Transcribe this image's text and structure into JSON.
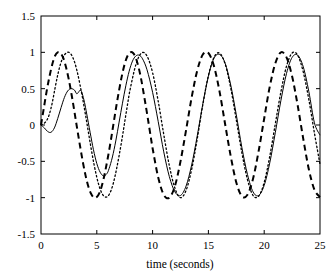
{
  "chart_data": {
    "type": "line",
    "title": "",
    "xlabel": "time (seconds)",
    "ylabel": "",
    "xlim": [
      0,
      25
    ],
    "ylim": [
      -1.5,
      1.5
    ],
    "xticks": [
      0,
      5,
      10,
      15,
      20,
      25
    ],
    "xtick_labels": [
      "0",
      "5",
      "10",
      "15",
      "20",
      "25"
    ],
    "yticks": [
      -1.5,
      -1,
      -0.5,
      0,
      0.5,
      1,
      1.5
    ],
    "ytick_labels": [
      "-1.5",
      "-1",
      "-0.5",
      "0",
      "0.5",
      "1",
      "1.5"
    ],
    "grid": false,
    "legend": "none",
    "background": "#ffffff",
    "axis_color": "#000000",
    "series": [
      {
        "name": "reference",
        "style": "dashed",
        "color": "#000000",
        "linewidth": 2.0,
        "dash": "6,4",
        "amplitude": 1.0,
        "period": 6.55,
        "phase_seconds": 1.55,
        "settling_time": 0.0,
        "points_x": [
          0,
          0.25,
          0.5,
          0.75,
          1,
          1.25,
          1.5,
          1.75,
          2,
          2.25,
          2.5,
          2.75,
          3,
          3.25,
          3.5,
          3.75,
          4,
          4.25,
          4.5,
          4.75,
          5,
          5.25,
          5.5,
          5.75,
          6,
          6.25,
          6.5,
          6.75,
          7,
          7.25,
          7.5,
          7.75,
          8,
          8.25,
          8.5,
          8.75,
          9,
          9.25,
          9.5,
          9.75,
          10,
          10.5,
          11,
          11.5,
          12,
          12.5,
          13,
          13.5,
          14,
          14.5,
          15,
          15.5,
          16,
          16.5,
          17,
          17.5,
          18,
          18.5,
          19,
          19.5,
          20,
          20.5,
          21,
          21.5,
          22,
          22.5,
          23,
          23.5,
          24,
          24.5,
          25
        ],
        "points_y": [
          0,
          0.23,
          0.46,
          0.66,
          0.83,
          0.95,
          1.0,
          0.99,
          0.92,
          0.79,
          0.62,
          0.41,
          0.18,
          -0.06,
          -0.29,
          -0.51,
          -0.7,
          -0.85,
          -0.95,
          -1.0,
          -0.99,
          -0.93,
          -0.81,
          -0.64,
          -0.44,
          -0.22,
          0.02,
          0.26,
          0.48,
          0.68,
          0.84,
          0.95,
          1.0,
          0.99,
          0.92,
          0.79,
          0.61,
          0.39,
          0.16,
          -0.08,
          -0.32,
          -0.72,
          -0.96,
          -1.0,
          -0.84,
          -0.5,
          -0.07,
          0.38,
          0.75,
          0.97,
          0.99,
          0.81,
          0.46,
          0.01,
          -0.43,
          -0.79,
          -0.98,
          -0.96,
          -0.74,
          -0.36,
          0.09,
          0.53,
          0.85,
          1.0,
          0.93,
          0.67,
          0.27,
          -0.19,
          -0.61,
          -0.89,
          -0.99
        ]
      },
      {
        "name": "dotted-response",
        "style": "dotted",
        "color": "#000000",
        "linewidth": 1.3,
        "dash": "1.5,2.5",
        "amplitude": 1.0,
        "period": 6.55,
        "phase_seconds": 2.55,
        "settling_time": 8.0,
        "points_x": [
          0,
          0.25,
          0.5,
          0.75,
          1,
          1.25,
          1.5,
          1.75,
          2,
          2.25,
          2.5,
          2.75,
          3,
          3.25,
          3.5,
          3.75,
          4,
          4.25,
          4.5,
          4.75,
          5,
          5.25,
          5.5,
          5.75,
          6,
          6.25,
          6.5,
          6.75,
          7,
          7.25,
          7.5,
          7.75,
          8,
          8.5,
          9,
          9.5,
          10,
          10.5,
          11,
          11.5,
          12,
          12.5,
          13,
          13.5,
          14,
          14.5,
          15,
          15.5,
          16,
          16.5,
          17,
          17.5,
          18,
          18.5,
          19,
          19.5,
          20,
          20.5,
          21,
          21.5,
          22,
          22.5,
          23,
          23.5,
          24,
          24.5,
          25
        ],
        "points_y": [
          0,
          0.02,
          0.06,
          0.15,
          0.3,
          0.5,
          0.69,
          0.84,
          0.94,
          0.99,
          1.0,
          0.96,
          0.87,
          0.73,
          0.55,
          0.35,
          0.13,
          -0.1,
          -0.33,
          -0.54,
          -0.72,
          -0.86,
          -0.95,
          -0.99,
          -0.98,
          -0.91,
          -0.79,
          -0.62,
          -0.42,
          -0.2,
          0.04,
          0.28,
          0.5,
          0.83,
          0.99,
          0.95,
          0.72,
          0.33,
          -0.13,
          -0.56,
          -0.87,
          -1.0,
          -0.9,
          -0.61,
          -0.19,
          0.28,
          0.68,
          0.93,
          0.99,
          0.84,
          0.51,
          0.07,
          -0.38,
          -0.75,
          -0.97,
          -0.98,
          -0.79,
          -0.43,
          0.02,
          0.46,
          0.81,
          0.99,
          0.96,
          0.73,
          0.35,
          -0.11,
          -0.54
        ]
      },
      {
        "name": "solid-response",
        "style": "solid",
        "color": "#000000",
        "linewidth": 1.0,
        "dash": "none",
        "amplitude": 1.0,
        "period": 6.55,
        "phase_seconds": 3.6,
        "settling_time": 8.0,
        "points_x": [
          0,
          0.3,
          0.6,
          0.9,
          1.2,
          1.5,
          1.8,
          2.1,
          2.4,
          2.7,
          3,
          3.2,
          3.4,
          3.5,
          3.6,
          3.7,
          3.9,
          4.1,
          4.4,
          4.7,
          5,
          5.3,
          5.6,
          5.9,
          6.1,
          6.4,
          6.7,
          7,
          7.3,
          7.6,
          7.9,
          8.2,
          8.5,
          8.8,
          9.1,
          9.5,
          10,
          10.5,
          11,
          11.5,
          12,
          12.5,
          13,
          13.5,
          14,
          14.5,
          15,
          15.5,
          16,
          16.5,
          17,
          17.5,
          18,
          18.5,
          19,
          19.5,
          20,
          20.5,
          21,
          21.5,
          22,
          22.5,
          23,
          23.5,
          24,
          24.5,
          25
        ],
        "points_y": [
          0,
          -0.04,
          -0.09,
          -0.1,
          -0.04,
          0.09,
          0.24,
          0.38,
          0.47,
          0.5,
          0.48,
          0.43,
          0.46,
          0.48,
          0.47,
          0.43,
          0.31,
          0.15,
          -0.1,
          -0.34,
          -0.53,
          -0.65,
          -0.7,
          -0.67,
          -0.6,
          -0.44,
          -0.22,
          0.04,
          0.3,
          0.54,
          0.74,
          0.88,
          0.95,
          0.96,
          0.91,
          0.76,
          0.45,
          0.05,
          -0.37,
          -0.71,
          -0.92,
          -0.97,
          -0.84,
          -0.55,
          -0.15,
          0.29,
          0.67,
          0.92,
          0.97,
          0.85,
          0.55,
          0.14,
          -0.31,
          -0.68,
          -0.92,
          -0.97,
          -0.83,
          -0.52,
          -0.1,
          0.34,
          0.71,
          0.93,
          0.96,
          0.8,
          0.46,
          0.03,
          -0.14
        ]
      }
    ]
  },
  "figure": {
    "plot_left_px": 41,
    "plot_right_px": 320,
    "plot_top_px": 16,
    "plot_bottom_px": 234
  }
}
